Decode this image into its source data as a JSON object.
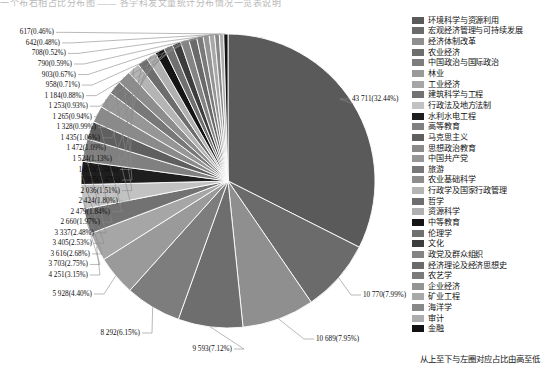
{
  "top_strip": "一个布右相占比分布图 —— 各学科发文量统计分布情况一览表说明",
  "legend": {
    "note": "从上至下与左圈对应占比由高至低",
    "items": [
      {
        "label": "环境科学与资源利用",
        "color": "#5a5a5a"
      },
      {
        "label": "宏观经济管理与可持续发展",
        "color": "#6b6b6b"
      },
      {
        "label": "经济体制改革",
        "color": "#8f8f8f"
      },
      {
        "label": "农业经济",
        "color": "#6e6e6e"
      },
      {
        "label": "中国政治与国际政治",
        "color": "#7d7d7d"
      },
      {
        "label": "林业",
        "color": "#9a9a9a"
      },
      {
        "label": "工业经济",
        "color": "#a6a6a6"
      },
      {
        "label": "建筑科学与工程",
        "color": "#727272"
      },
      {
        "label": "行政法及地方法制",
        "color": "#c2c2c2"
      },
      {
        "label": "水利水电工程",
        "color": "#1e1e1e"
      },
      {
        "label": "高等教育",
        "color": "#808080"
      },
      {
        "label": "马克思主义",
        "color": "#5f5f5f"
      },
      {
        "label": "思想政治教育",
        "color": "#8a8a8a"
      },
      {
        "label": "中国共产党",
        "color": "#969696"
      },
      {
        "label": "旅游",
        "color": "#787878"
      },
      {
        "label": "农业基础科学",
        "color": "#8d8d8d"
      },
      {
        "label": "行政学及国家行政管理",
        "color": "#b4b4b4"
      },
      {
        "label": "哲学",
        "color": "#6d6d6d"
      },
      {
        "label": "资源科学",
        "color": "#b0b0b0"
      },
      {
        "label": "中等教育",
        "color": "#151515"
      },
      {
        "label": "伦理学",
        "color": "#707070"
      },
      {
        "label": "文化",
        "color": "#3d3d3d"
      },
      {
        "label": "政党及群众组织",
        "color": "#848484"
      },
      {
        "label": "经济理论及经济思想史",
        "color": "#6a6a6a"
      },
      {
        "label": "农艺学",
        "color": "#7a7a7a"
      },
      {
        "label": "企业经济",
        "color": "#949494"
      },
      {
        "label": "矿业工程",
        "color": "#a8a8a8"
      },
      {
        "label": "海洋学",
        "color": "#888888"
      },
      {
        "label": "审计",
        "color": "#adadad"
      },
      {
        "label": "金融",
        "color": "#121212"
      }
    ]
  },
  "chart_data": {
    "type": "pie",
    "title": "",
    "legend_position": "right",
    "note": "从上至下与左圈对应占比由高至低",
    "total": 134740,
    "categories": [
      "环境科学与资源利用",
      "宏观经济管理与可持续发展",
      "经济体制改革",
      "农业经济",
      "中国政治与国际政治",
      "林业",
      "工业经济",
      "建筑科学与工程",
      "行政法及地方法制",
      "水利水电工程",
      "高等教育",
      "马克思主义",
      "思想政治教育",
      "中国共产党",
      "旅游",
      "农业基础科学",
      "行政学及国家行政管理",
      "哲学",
      "资源科学",
      "中等教育",
      "伦理学",
      "文化",
      "政党及群众组织",
      "经济理论及经济思想史",
      "农艺学",
      "企业经济",
      "矿业工程",
      "海洋学",
      "审计",
      "金融"
    ],
    "values": [
      43711,
      10770,
      10689,
      9593,
      8292,
      5928,
      4251,
      3703,
      3616,
      3405,
      3337,
      2660,
      2479,
      2424,
      2036,
      1985,
      1803,
      1524,
      1472,
      1435,
      1328,
      1265,
      1253,
      1184,
      958,
      903,
      790,
      708,
      642,
      617
    ],
    "percents": [
      32.44,
      7.99,
      7.95,
      7.12,
      6.15,
      4.4,
      3.15,
      2.75,
      2.68,
      2.53,
      2.48,
      1.97,
      1.84,
      1.8,
      1.51,
      1.47,
      1.34,
      1.13,
      1.09,
      1.06,
      0.99,
      0.94,
      0.93,
      0.88,
      0.71,
      0.67,
      0.59,
      0.52,
      0.48,
      0.46
    ],
    "labels": [
      "43 711(32.44%)",
      "10 770(7.99%)",
      "10 689(7.95%)",
      "9 593(7.12%)",
      "8 292(6.15%)",
      "5 928(4.40%)",
      "4 251(3.15%)",
      "3 703(2.75%)",
      "3 616(2.68%)",
      "3 405(2.53%)",
      "3 337(2.48%)",
      "2 660(1.97%)",
      "2 479(1.84%)",
      "2 424(1.80%)",
      "2 036(1.51%)",
      "1 985(1.47%)",
      "1 803(1.34%)",
      "1 524(1.13%)",
      "1 472(1.09%)",
      "1 435(1.06%)",
      "1 328(0.99%)",
      "1 265(0.94%)",
      "1 253(0.93%)",
      "1 184(0.88%)",
      "958(0.71%)",
      "903(0.67%)",
      "790(0.59%)",
      "708(0.52%)",
      "642(0.48%)",
      "617(0.46%)"
    ],
    "colors": [
      "#5a5a5a",
      "#6b6b6b",
      "#8f8f8f",
      "#6e6e6e",
      "#7d7d7d",
      "#9a9a9a",
      "#a6a6a6",
      "#727272",
      "#c2c2c2",
      "#1e1e1e",
      "#808080",
      "#5f5f5f",
      "#8a8a8a",
      "#969696",
      "#787878",
      "#8d8d8d",
      "#b4b4b4",
      "#6d6d6d",
      "#b0b0b0",
      "#151515",
      "#707070",
      "#3d3d3d",
      "#848484",
      "#6a6a6a",
      "#7a7a7a",
      "#949494",
      "#a8a8a8",
      "#888888",
      "#adadad",
      "#121212"
    ]
  }
}
